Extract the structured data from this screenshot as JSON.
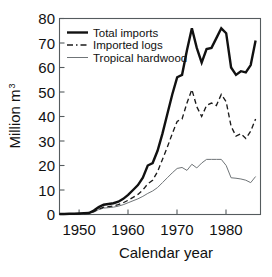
{
  "chart_data": {
    "type": "line",
    "title": "",
    "xlabel": "Calendar year",
    "ylabel": "Million m",
    "ylabel_superscript": "3",
    "xlim": [
      1946,
      1987
    ],
    "ylim": [
      0,
      80
    ],
    "grid": false,
    "legend_position": "top-left",
    "x_ticks": [
      1950,
      1960,
      1970,
      1980
    ],
    "x_tick_labels": [
      "1950",
      "1960",
      "1970",
      "1980"
    ],
    "y_ticks": [
      0,
      10,
      20,
      30,
      40,
      50,
      60,
      70,
      80
    ],
    "y_tick_labels": [
      "0",
      "10",
      "20",
      "30",
      "40",
      "50",
      "60",
      "70",
      "80"
    ],
    "x": [
      1946,
      1947,
      1948,
      1949,
      1950,
      1951,
      1952,
      1953,
      1954,
      1955,
      1956,
      1957,
      1958,
      1959,
      1960,
      1961,
      1962,
      1963,
      1964,
      1965,
      1966,
      1967,
      1968,
      1969,
      1970,
      1971,
      1972,
      1973,
      1974,
      1975,
      1976,
      1977,
      1978,
      1979,
      1980,
      1981,
      1982,
      1983,
      1984,
      1985,
      1986
    ],
    "series": [
      {
        "name": "Total imports",
        "style": "thick-solid",
        "color": "#111111",
        "values": [
          0.2,
          0.2,
          0.3,
          0.3,
          0.4,
          0.5,
          0.6,
          1.6,
          3.0,
          4.0,
          4.3,
          4.6,
          5.2,
          6.4,
          8.0,
          10.0,
          12.0,
          15.0,
          20.0,
          21.0,
          26.0,
          33.0,
          41.0,
          49.0,
          56.0,
          57.0,
          67.0,
          76.0,
          68.0,
          62.0,
          67.5,
          68.0,
          72.0,
          76.0,
          74.0,
          60.0,
          57.0,
          58.5,
          58.0,
          61.0,
          71.0
        ]
      },
      {
        "name": "Imported logs",
        "style": "dashed",
        "color": "#1b1b1b",
        "values": [
          0.1,
          0.1,
          0.2,
          0.2,
          0.3,
          0.4,
          0.5,
          1.2,
          2.2,
          3.0,
          3.2,
          3.5,
          4.0,
          4.8,
          5.8,
          7.0,
          8.2,
          10.0,
          12.5,
          14.0,
          17.5,
          22.5,
          27.5,
          33.0,
          38.0,
          39.0,
          45.5,
          51.0,
          44.0,
          40.0,
          44.5,
          45.5,
          44.5,
          49.0,
          46.0,
          36.0,
          32.0,
          33.0,
          31.0,
          34.0,
          39.0
        ]
      },
      {
        "name": "Tropical hardwood",
        "style": "thin-solid",
        "color": "#6f7477",
        "values": [
          0.1,
          0.1,
          0.1,
          0.2,
          0.2,
          0.3,
          0.4,
          1.0,
          2.0,
          2.6,
          2.8,
          3.0,
          3.4,
          4.0,
          4.8,
          5.6,
          6.4,
          7.4,
          8.6,
          9.6,
          11.0,
          13.0,
          15.0,
          17.0,
          18.8,
          19.2,
          18.0,
          20.5,
          19.0,
          21.0,
          22.5,
          22.5,
          22.5,
          22.5,
          20.0,
          15.0,
          14.8,
          14.5,
          14.0,
          13.0,
          15.5
        ]
      }
    ]
  },
  "legend": {
    "items": [
      {
        "label": "Total imports",
        "style": "thick-solid"
      },
      {
        "label": "Imported logs",
        "style": "dashed"
      },
      {
        "label": "Tropical hardwood",
        "style": "thin-solid"
      }
    ]
  }
}
